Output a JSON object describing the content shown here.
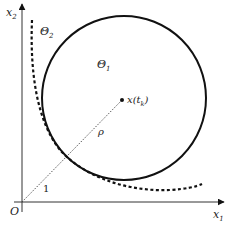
{
  "diagram": {
    "axes": {
      "x_label": "x",
      "x_label_sub": "1",
      "y_label": "x",
      "y_label_sub": "2",
      "origin_label": "O"
    },
    "regions": {
      "theta1_label": "Θ",
      "theta1_sub": "1",
      "theta2_label": "Θ",
      "theta2_sub": "2"
    },
    "center_point": {
      "label_main": "x(t",
      "label_sub": "k",
      "label_close": ")"
    },
    "segments": {
      "radius_label": "ρ",
      "unit_label": "1"
    },
    "colors": {
      "stroke": "#111111",
      "dotted": "#444444",
      "background": "#ffffff"
    }
  }
}
